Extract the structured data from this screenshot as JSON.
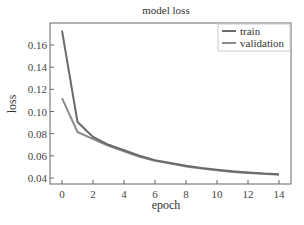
{
  "chart_data": {
    "type": "line",
    "title": "model loss",
    "xlabel": "epoch",
    "ylabel": "loss",
    "x": [
      0,
      1,
      2,
      3,
      4,
      5,
      6,
      7,
      8,
      9,
      10,
      11,
      12,
      13,
      14
    ],
    "series": [
      {
        "name": "train",
        "color": "#6a6a6a",
        "values": [
          0.173,
          0.0905,
          0.077,
          0.07,
          0.065,
          0.06,
          0.056,
          0.0535,
          0.051,
          0.049,
          0.0475,
          0.046,
          0.045,
          0.044,
          0.0433
        ]
      },
      {
        "name": "validation",
        "color": "#8c8c8c",
        "values": [
          0.112,
          0.0815,
          0.075,
          0.069,
          0.064,
          0.059,
          0.0555,
          0.053,
          0.0505,
          0.0485,
          0.047,
          0.0455,
          0.0445,
          0.0438,
          0.043
        ]
      }
    ],
    "xlim": [
      -0.8,
      14.8
    ],
    "ylim": [
      0.036,
      0.18
    ],
    "xticks": [
      0,
      2,
      4,
      6,
      8,
      10,
      12,
      14
    ],
    "yticks": [
      0.04,
      0.06,
      0.08,
      0.1,
      0.12,
      0.14,
      0.16
    ],
    "ytick_labels": [
      "0.04",
      "0.06",
      "0.08",
      "0.10",
      "0.12",
      "0.14",
      "0.16"
    ],
    "grid": false,
    "legend_position": "upper right"
  }
}
